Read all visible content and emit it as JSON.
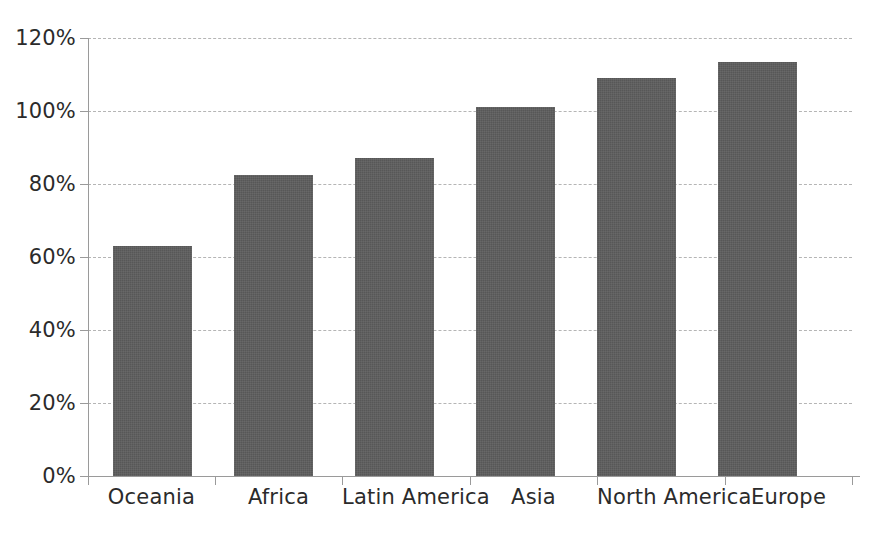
{
  "chart_data": {
    "type": "bar",
    "title": "",
    "subtitle": "",
    "xlabel": "",
    "ylabel": "",
    "categories": [
      "Oceania",
      "Africa",
      "Latin America",
      "Asia",
      "North America",
      "Europe"
    ],
    "values": [
      63,
      82.5,
      87,
      101,
      109,
      113.5
    ],
    "value_unit": "%",
    "ylim": [
      0,
      120
    ],
    "ytick_values": [
      0,
      20,
      40,
      60,
      80,
      100,
      120
    ],
    "ytick_labels": [
      "0%",
      "20%",
      "40%",
      "60%",
      "80%",
      "100%",
      "120%"
    ],
    "grid": "horizontal-dashed",
    "legend": "none",
    "series": [
      {
        "name": "",
        "values": [
          63,
          82.5,
          87,
          101,
          109,
          113.5
        ],
        "color": "#575757"
      }
    ],
    "colors": {
      "bar": "#575757",
      "gridline": "#b5b5b5",
      "axis": "#9a9a9a",
      "text": "#2b2b2b",
      "background": "#ffffff"
    }
  }
}
